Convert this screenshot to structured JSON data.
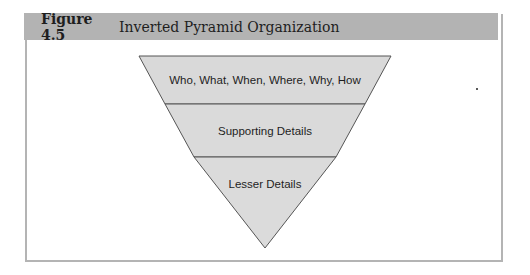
{
  "figure": {
    "label": "Figure 4.5",
    "title": "Inverted Pyramid Organization"
  },
  "diagram": {
    "type": "inverted-pyramid",
    "fill_color": "#d9d9d9",
    "stroke_color": "#555555",
    "segments": [
      {
        "label": "Who, What, When, Where, Why, How"
      },
      {
        "label": "Supporting Details"
      },
      {
        "label": "Lesser Details"
      }
    ]
  }
}
